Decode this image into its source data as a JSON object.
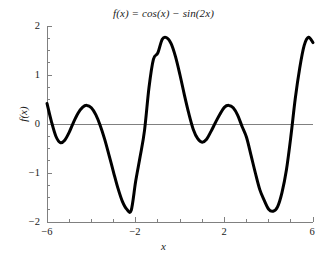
{
  "chart_data": {
    "type": "line",
    "title": "f(x) = cos(x) − sin(2x)",
    "xlabel": "x",
    "ylabel": "f(x)",
    "xlim": [
      -6,
      6
    ],
    "ylim": [
      -2,
      2
    ],
    "grid": false,
    "legend": null,
    "zero_line": true,
    "zero_line_color": "#808080",
    "line_color": "#000000",
    "line_width": 3,
    "x_major_ticks": [
      -6,
      -2,
      2,
      6
    ],
    "x_major_tick_labels": [
      "−6",
      "−2",
      "2",
      "6"
    ],
    "x_minor_ticks": [
      -5,
      -4,
      -3,
      -1,
      0,
      1,
      3,
      4,
      5
    ],
    "y_major_ticks": [
      -2,
      -1,
      0,
      1,
      2
    ],
    "y_major_tick_labels": [
      "−2",
      "−1",
      "0",
      "1",
      "2"
    ],
    "y_minor_ticks": [
      -1.75,
      -1.5,
      -1.25,
      -0.75,
      -0.5,
      -0.25,
      0.25,
      0.5,
      0.75,
      1.25,
      1.5,
      1.75
    ],
    "series": [
      {
        "name": "f(x) = cos(x) − sin(2x)",
        "x": [
          -6.0,
          -5.8,
          -5.6,
          -5.4,
          -5.2,
          -5.0,
          -4.8,
          -4.6,
          -4.4,
          -4.2,
          -4.0,
          -3.8,
          -3.6,
          -3.4,
          -3.2,
          -3.0,
          -2.8,
          -2.6,
          -2.4,
          -2.2,
          -2.0,
          -1.8,
          -1.6,
          -1.4,
          -1.2,
          -1.0,
          -0.8,
          -0.6,
          -0.4,
          -0.2,
          0.0,
          0.2,
          0.4,
          0.6,
          0.8,
          1.0,
          1.2,
          1.4,
          1.6,
          1.8,
          2.0,
          2.2,
          2.4,
          2.6,
          2.8,
          3.0,
          3.2,
          3.4,
          3.6,
          3.8,
          4.0,
          4.2,
          4.4,
          4.6,
          4.8,
          5.0,
          5.2,
          5.4,
          5.6,
          5.8,
          6.0
        ],
        "y": [
          0.42,
          0.05,
          -0.25,
          -0.38,
          -0.33,
          -0.17,
          0.04,
          0.22,
          0.34,
          0.38,
          0.33,
          0.19,
          -0.03,
          -0.31,
          -0.64,
          -0.98,
          -1.31,
          -1.58,
          -1.74,
          -1.76,
          -1.17,
          -0.67,
          -0.13,
          0.74,
          1.32,
          1.45,
          1.73,
          1.76,
          1.64,
          1.37,
          1.0,
          0.59,
          0.21,
          -0.11,
          -0.3,
          -0.37,
          -0.31,
          -0.15,
          0.03,
          0.2,
          0.34,
          0.38,
          0.33,
          0.18,
          -0.05,
          -0.27,
          -0.63,
          -1.0,
          -1.34,
          -1.56,
          -1.74,
          -1.78,
          -1.69,
          -1.4,
          -0.94,
          -0.26,
          0.52,
          1.14,
          1.6,
          1.77,
          1.66
        ],
        "style": "solid"
      }
    ],
    "sampled_points_note": "curve of f(x)=cos(x)-sin(2x)"
  },
  "axes": {
    "spines": {
      "left": true,
      "bottom": true,
      "top": false,
      "right": false
    },
    "spine_color": "#808080"
  }
}
